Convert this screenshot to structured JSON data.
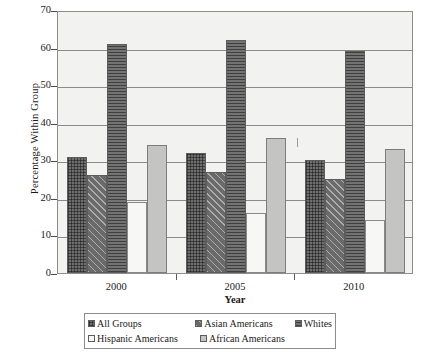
{
  "chart_data": {
    "type": "bar",
    "title": "",
    "xlabel": "Year",
    "ylabel": "Percentage Within Group",
    "categories": [
      "2000",
      "2005",
      "2010"
    ],
    "ylim": [
      0,
      70
    ],
    "yticks": [
      0,
      10,
      20,
      30,
      40,
      50,
      60,
      70
    ],
    "grid": true,
    "legend_position": "bottom",
    "series": [
      {
        "name": "All Groups",
        "values": [
          31,
          32,
          30
        ],
        "pattern": "dark-grey-crosshatch"
      },
      {
        "name": "Asian Americans",
        "values": [
          26,
          27,
          25
        ],
        "pattern": "dark-grey-diagonal"
      },
      {
        "name": "Whites",
        "values": [
          61,
          62,
          59
        ],
        "pattern": "dark-grey-horizontal"
      },
      {
        "name": "Hispanic Americans",
        "values": [
          19,
          16,
          14
        ],
        "pattern": "white-solid"
      },
      {
        "name": "African Americans",
        "values": [
          34,
          36,
          33
        ],
        "pattern": "light-grey-solid"
      }
    ]
  },
  "axes": {
    "y_title": "Percentage Within Group",
    "x_title": "Year",
    "y_tick_labels": [
      "70",
      "60",
      "50",
      "40",
      "30",
      "20",
      "10",
      "0"
    ],
    "x_tick_labels": [
      "2000",
      "2005",
      "2010"
    ]
  },
  "legend": {
    "row1": [
      {
        "label": "All Groups"
      },
      {
        "label": "Asian Americans"
      },
      {
        "label": "Whites"
      }
    ],
    "row2": [
      {
        "label": "Hispanic Americans"
      },
      {
        "label": "African Americans"
      }
    ]
  },
  "colors": {
    "plot_background": "#f2f2f0",
    "frame": "#8d8d8d",
    "gridline": "#8a8a8a",
    "all_groups": "#6e6e6e",
    "asian_americans": "#6a6a6a",
    "whites": "#737373",
    "hispanic_americans": "#f7f7f5",
    "african_americans": "#c4c4c2"
  }
}
